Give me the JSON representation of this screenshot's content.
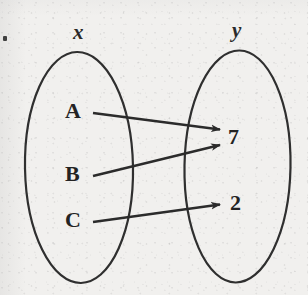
{
  "figure": {
    "type": "mapping-diagram",
    "background_color": "#f1f0ee",
    "ink_color": "#2b2b2b"
  },
  "sets": {
    "domain": {
      "label": "x",
      "elements": [
        "A",
        "B",
        "C"
      ]
    },
    "codomain": {
      "label": "y",
      "elements": [
        "7",
        "2"
      ]
    }
  },
  "mappings": [
    {
      "from": "A",
      "to": "7"
    },
    {
      "from": "B",
      "to": "7"
    },
    {
      "from": "C",
      "to": "2"
    }
  ],
  "marks": {
    "corner_dot": "·"
  }
}
